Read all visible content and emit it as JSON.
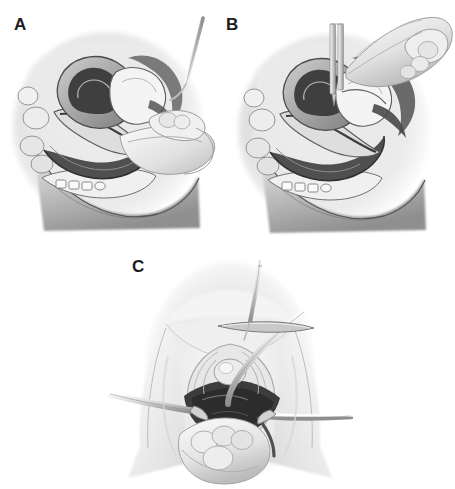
{
  "figure": {
    "style": "grayscale medical line-and-tone illustration",
    "background_color": "#ffffff",
    "label_color": "#1c1c1c",
    "panel_count": 3
  },
  "panels": [
    {
      "id": "A",
      "label": "A",
      "view": "sagittal-pelvic-cross-section",
      "caption_text": "",
      "description": "Mid-sagittal cross section of the female pelvis with an examining hand at the perineum and a thin needle instrument entering from the upper right.",
      "structures": [
        "uterus",
        "bladder",
        "vagina",
        "rectum",
        "pubic-symphysis",
        "bowel-loops",
        "buttock-contour"
      ],
      "instruments": [
        "needle",
        "examining-hand"
      ]
    },
    {
      "id": "B",
      "label": "B",
      "view": "sagittal-pelvic-cross-section",
      "caption_text": "",
      "description": "Same mid-sagittal pelvic cross section with a vertical trocar or cannula passed through the abdominal wall and steadied by the surgeon's gloved hand.",
      "structures": [
        "uterus",
        "bladder",
        "vagina",
        "rectum",
        "pubic-symphysis",
        "bowel-loops",
        "buttock-contour"
      ],
      "instruments": [
        "trocar-cannula",
        "surgeon-hand"
      ]
    },
    {
      "id": "C",
      "label": "C",
      "view": "perineal-frontal-view",
      "caption_text": "",
      "description": "Frontal perineal view of the vaginal introitus held open by two lateral retractors, with a curved needle on a needle holder above and a suction or dissecting instrument entering the field.",
      "structures": [
        "labia",
        "vaginal-introitus",
        "perineum",
        "thighs",
        "exposed-tissue-plane"
      ],
      "instruments": [
        "curved-needle",
        "needle-holder",
        "left-retractor",
        "right-retractor",
        "curved-probe",
        "assisting-hand"
      ]
    }
  ],
  "palette": {
    "background": "#ffffff",
    "ink": "#1c1c1c",
    "tissue_light": "#f2f2f2",
    "tissue_mid": "#cfcfcf",
    "tissue_shadow": "#9a9a9a",
    "cavity_dark": "#4a4a4a",
    "cavity_darkest": "#2e2e2e",
    "instrument_metal": "#e6e6e6",
    "instrument_edge": "#8c8c8c"
  }
}
